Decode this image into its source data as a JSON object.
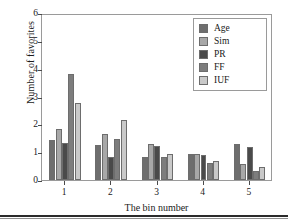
{
  "chart_data": {
    "type": "bar",
    "title": "",
    "xlabel": "The bin number",
    "ylabel": "Number of favorites",
    "categories": [
      "1",
      "2",
      "3",
      "4",
      "5"
    ],
    "xtick_labels": [
      "1",
      "2",
      "3",
      "4",
      "5"
    ],
    "ytick_labels": [
      "0",
      "1",
      "2",
      "3",
      "4",
      "5",
      "6"
    ],
    "ylim": [
      0,
      6
    ],
    "grid": false,
    "legend_position": "top-right",
    "series": [
      {
        "name": "Age",
        "color": "#6e6e6e",
        "values": [
          1.42,
          1.26,
          0.84,
          0.94,
          1.29
        ]
      },
      {
        "name": "Sim",
        "color": "#a8a8a8",
        "values": [
          1.85,
          1.66,
          1.29,
          0.92,
          0.57
        ]
      },
      {
        "name": "PR",
        "color": "#4a4a4a",
        "values": [
          1.33,
          0.84,
          1.22,
          0.9,
          1.17
        ]
      },
      {
        "name": "FF",
        "color": "#7d7d7d",
        "values": [
          3.82,
          1.49,
          0.84,
          0.61,
          0.32
        ]
      },
      {
        "name": "IUF",
        "color": "#c9c9c9",
        "values": [
          2.78,
          2.14,
          0.92,
          0.68,
          0.45
        ]
      }
    ]
  },
  "legend": {
    "items": [
      {
        "label": "Age"
      },
      {
        "label": "Sim"
      },
      {
        "label": "PR"
      },
      {
        "label": "FF"
      },
      {
        "label": "IUF"
      }
    ]
  },
  "axes": {
    "y_title": "Number of favorites",
    "x_title": "The bin number"
  }
}
